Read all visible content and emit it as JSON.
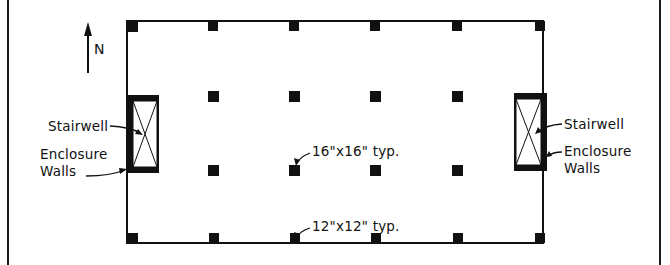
{
  "diagram": {
    "type": "structural floor plan",
    "north_label": "N",
    "labels": {
      "stairwell_left": "Stairwell",
      "enclosure_left_line1": "Enclosure",
      "enclosure_left_line2": "Walls",
      "stairwell_right": "Stairwell",
      "enclosure_right_line1": "Enclosure",
      "enclosure_right_line2": "Walls",
      "interior_column": "16\"x16\" typ.",
      "perimeter_column": "12\"x12\" typ."
    },
    "grid": {
      "perimeter_columns_x": [
        131,
        213,
        294,
        375,
        457,
        540
      ],
      "interior_columns_x": [
        213,
        294,
        375,
        457
      ],
      "interior_rows_y": [
        96,
        170
      ]
    },
    "colors": {
      "ink": "#111111",
      "paper": "#ffffff"
    }
  }
}
